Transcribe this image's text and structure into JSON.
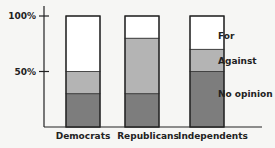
{
  "chart_data": {
    "type": "bar",
    "stacked": true,
    "title": "",
    "xlabel": "",
    "ylabel": "",
    "ylim": [
      0,
      100
    ],
    "yticks": [
      "50%",
      "100%"
    ],
    "categories": [
      "Democrats",
      "Republicans",
      "Independents"
    ],
    "series": [
      {
        "name": "No opinion",
        "values": [
          30,
          30,
          50
        ],
        "color": "#7d7d7d"
      },
      {
        "name": "Against",
        "values": [
          20,
          50,
          20
        ],
        "color": "#b4b4b4"
      },
      {
        "name": "For",
        "values": [
          50,
          20,
          30
        ],
        "color": "#ffffff"
      }
    ],
    "legend": [
      "For",
      "Against",
      "No opinion"
    ],
    "legend_position": "right",
    "grid": false
  }
}
